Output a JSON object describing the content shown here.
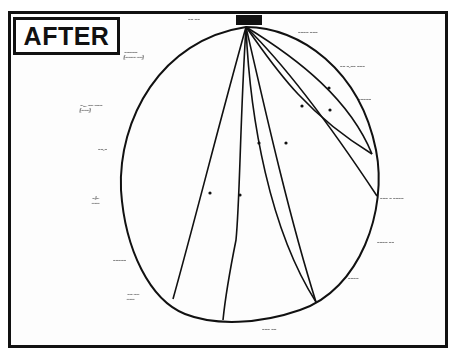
{
  "title": "AFTER",
  "diagram": {
    "type": "network-sociogram",
    "hub": {
      "label": "illegible handwritten label (hub)",
      "x": 246,
      "y": 27
    },
    "nodes": [
      {
        "id": "n1",
        "label": "illegible",
        "x": 372,
        "y": 154,
        "label_x": 380,
        "label_y": 148
      },
      {
        "id": "n2",
        "label": "illegible",
        "x": 377,
        "y": 196,
        "label_x": 383,
        "label_y": 194
      },
      {
        "id": "n3",
        "label": "illegible",
        "x": 316,
        "y": 302,
        "label_x": 318,
        "label_y": 306
      },
      {
        "id": "n4",
        "label": "illegible",
        "x": 223,
        "y": 320,
        "label_x": 202,
        "label_y": 325
      },
      {
        "id": "n5",
        "label": "illegible",
        "x": 173,
        "y": 299,
        "label_x": 147,
        "label_y": 310
      }
    ],
    "edges": [
      {
        "from": "hub",
        "to": "n1"
      },
      {
        "from": "hub",
        "to": "n1",
        "curved": true
      },
      {
        "from": "hub",
        "to": "n2"
      },
      {
        "from": "hub",
        "to": "n3"
      },
      {
        "from": "hub",
        "to": "n3",
        "curved": true
      },
      {
        "from": "hub",
        "to": "n4"
      },
      {
        "from": "hub",
        "to": "n5"
      }
    ],
    "perimeter_labels": [
      {
        "text": "~~ ~~",
        "x": 188,
        "y": 17
      },
      {
        "text": "~~~~ ~~~",
        "x": 298,
        "y": 30
      },
      {
        "text": "~~ ~.~~ ~~~",
        "x": 340,
        "y": 64
      },
      {
        "text": "~~~~~",
        "x": 358,
        "y": 97
      },
      {
        "text": "~~~ ~ ~~~~",
        "x": 380,
        "y": 196
      },
      {
        "text": "~~~~ ~~",
        "x": 377,
        "y": 240
      },
      {
        "text": "~~~~",
        "x": 348,
        "y": 276
      },
      {
        "text": "~~~ ~~",
        "x": 262,
        "y": 327
      },
      {
        "text": "~~~~~",
        "x": 113,
        "y": 258
      },
      {
        "text": "~~ ~~ / ~~~",
        "x": 127,
        "y": 292
      },
      {
        "text": "~~~~~ / (~~~~ ~~)",
        "x": 124,
        "y": 50
      },
      {
        "text": "~... ~~ ~~~ / (~~~)",
        "x": 80,
        "y": 103
      },
      {
        "text": "~~.~",
        "x": 98,
        "y": 147
      },
      {
        "text": "~/~ / ~~~",
        "x": 92,
        "y": 196
      }
    ]
  }
}
